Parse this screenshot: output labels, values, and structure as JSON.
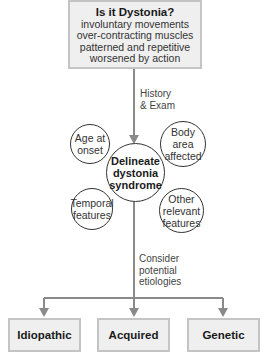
{
  "diagram": {
    "top_box": {
      "title": "Is it Dystonia?",
      "lines": [
        "involuntary movements",
        "over-contracting muscles",
        "patterned and repetitive",
        "worsened by action"
      ]
    },
    "edge_history": {
      "line1": "History",
      "line2": "& Exam"
    },
    "center": {
      "line1": "Delineate",
      "line2": "dystonia",
      "line3": "syndrome"
    },
    "satellites": {
      "age": {
        "line1": "Age at",
        "line2": "onset"
      },
      "body": {
        "line1": "Body area",
        "line2": "affected"
      },
      "temporal": {
        "line1": "Temporal",
        "line2": "features"
      },
      "other": {
        "line1": "Other",
        "line2": "relevant",
        "line3": "features"
      }
    },
    "edge_consider": {
      "line1": "Consider",
      "line2": "potential",
      "line3": "etiologies"
    },
    "leaves": [
      {
        "label": "Idiopathic"
      },
      {
        "label": "Acquired"
      },
      {
        "label": "Genetic"
      }
    ],
    "colors": {
      "box_fill": "#efefef",
      "box_border": "#c4c4c4",
      "arrow": "#8a8a8a",
      "circle_border": "#333333"
    }
  }
}
